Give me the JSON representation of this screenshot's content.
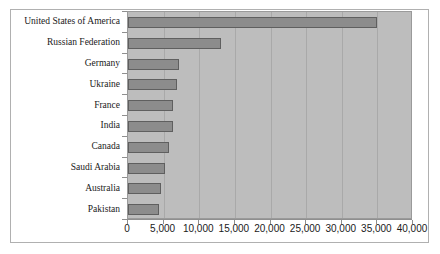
{
  "chart_data": {
    "type": "bar",
    "orientation": "horizontal",
    "title": "",
    "subtitle": "",
    "xlabel": "",
    "ylabel": "",
    "categories": [
      "United States of America",
      "Russian Federation",
      "Germany",
      "Ukraine",
      "France",
      "India",
      "Canada",
      "Saudi Arabia",
      "Australia",
      "Pakistan"
    ],
    "values": [
      35000,
      13000,
      7100,
      6900,
      6300,
      6300,
      5800,
      5200,
      4600,
      4350
    ],
    "xlim": [
      0,
      40000
    ],
    "xticks": [
      0,
      5000,
      10000,
      15000,
      20000,
      25000,
      30000,
      35000,
      40000
    ],
    "xticklabels": [
      "0",
      "5,000",
      "10,000",
      "15,000",
      "20,000",
      "25,000",
      "30,000",
      "35,000",
      "40,000"
    ],
    "grid": true,
    "grid_axis": "x",
    "legend": false,
    "legend_position": "none",
    "series": [
      {
        "name": "",
        "values": [
          35000,
          13000,
          7100,
          6900,
          6300,
          6300,
          5800,
          5200,
          4600,
          4350
        ]
      }
    ]
  },
  "colors": {
    "bar_fill": "#8c8c8c",
    "bar_edge": "#5f5f5f",
    "plot_background": "#bdbdbd",
    "gridline": "#a9a9a9",
    "axis": "#8f8f8f",
    "frame": "#b0b0b0",
    "text": "#1a1a1a",
    "page_background": "#ffffff"
  }
}
